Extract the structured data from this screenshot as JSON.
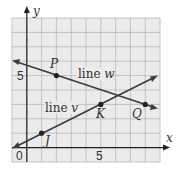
{
  "diagram": {
    "type": "coordinate-plane",
    "axes": {
      "x_label": "x",
      "y_label": "y",
      "origin_label": "0",
      "x_tick_label": "5",
      "y_tick_label": "5"
    },
    "grid": {
      "x_min": -1,
      "x_max": 9,
      "y_min": -1,
      "y_max": 9
    },
    "lines": [
      {
        "name": "line w",
        "prefix": "line ",
        "var": "w",
        "through": [
          "P",
          "Q"
        ]
      },
      {
        "name": "line v",
        "prefix": "line ",
        "var": "v",
        "through": [
          "J",
          "K"
        ]
      }
    ],
    "points": [
      {
        "label": "P",
        "x": 2,
        "y": 5
      },
      {
        "label": "Q",
        "x": 8,
        "y": 3
      },
      {
        "label": "J",
        "x": 1,
        "y": 1
      },
      {
        "label": "K",
        "x": 5,
        "y": 3
      }
    ]
  }
}
